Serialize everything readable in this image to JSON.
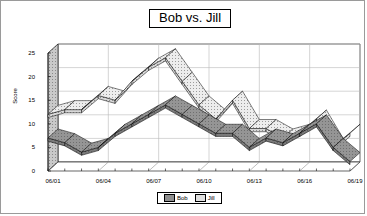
{
  "chart_data": {
    "type": "area",
    "title": "Bob vs. Jill",
    "xlabel": "",
    "ylabel": "Score",
    "ylim": [
      0,
      25
    ],
    "ytick_values": [
      0,
      5,
      10,
      15,
      20,
      25
    ],
    "grid": true,
    "legend_position": "bottom",
    "three_d": true,
    "categories": [
      "06/01",
      "06/02",
      "06/03",
      "06/04",
      "06/05",
      "06/06",
      "06/07",
      "06/08",
      "06/09",
      "06/10",
      "06/11",
      "06/12",
      "06/13",
      "06/14",
      "06/15",
      "06/16",
      "06/17",
      "06/18",
      "06/19"
    ],
    "xtick_labels": [
      "06/01",
      "06/04",
      "06/07",
      "06/10",
      "06/13",
      "06/16",
      "06/19"
    ],
    "series": [
      {
        "name": "Bob",
        "values": [
          7,
          6,
          4,
          5,
          8,
          10,
          12,
          14,
          12,
          10,
          8,
          8,
          5,
          7,
          6,
          8,
          10,
          5,
          2
        ]
      },
      {
        "name": "Jill",
        "values": [
          12,
          13,
          13,
          16,
          15,
          19,
          22,
          24,
          19,
          14,
          11,
          15,
          9,
          9,
          7,
          8,
          11,
          5,
          8
        ]
      }
    ]
  },
  "legend": {
    "entries": [
      {
        "label": "Bob",
        "color": "#8f8f8f"
      },
      {
        "label": "Jill",
        "color": "#e0e0e0"
      }
    ]
  },
  "colors": {
    "bob_fill": "#8f8f8f",
    "jill_fill": "#e8e8e8",
    "axis": "#000000",
    "grid": "#b9b9b9",
    "border": "#9a9a9a"
  }
}
